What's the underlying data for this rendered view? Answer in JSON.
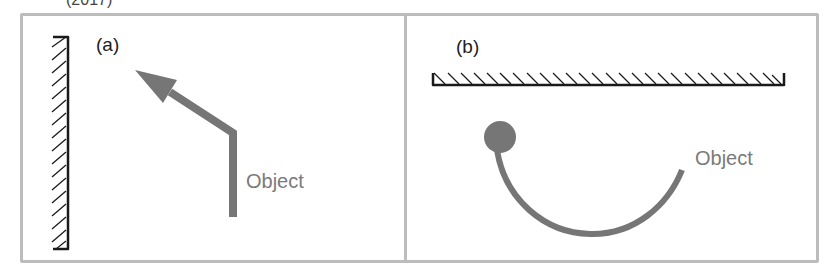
{
  "figure": {
    "cutoff_caption": "(2017)",
    "colors": {
      "frame": "#bcbcbc",
      "mirror": "#1a1a1a",
      "object": "#767676",
      "object_label": "#7a7a7a",
      "panel_label": "#222222"
    },
    "panels": [
      {
        "id": "a",
        "label": "(a)",
        "mirror_orientation": "vertical",
        "object_label": "Object",
        "object_shape": "bent-arrow"
      },
      {
        "id": "b",
        "label": "(b)",
        "mirror_orientation": "horizontal",
        "object_label": "Object",
        "object_shape": "curved-rod-with-ball"
      }
    ]
  }
}
